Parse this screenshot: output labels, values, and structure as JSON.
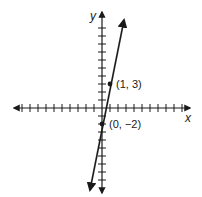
{
  "chart_data": {
    "type": "line",
    "title": "",
    "xlabel": "x",
    "ylabel": "y",
    "xlim": [
      -11,
      10
    ],
    "ylim": [
      -11,
      12
    ],
    "grid": false,
    "equation": "y = 5x - 2",
    "series": [
      {
        "name": "line",
        "x": [
          -2.3,
          3
        ],
        "y": [
          -10.2,
          12
        ]
      }
    ],
    "points": [
      {
        "label": "(1, 3)",
        "x": 1,
        "y": 3
      },
      {
        "label": "(0, −2)",
        "x": 0,
        "y": -2
      }
    ],
    "color": "#1a1a1a"
  },
  "axes": {
    "x_label": "x",
    "y_label": "y"
  },
  "points": [
    {
      "label": "(1, 3)"
    },
    {
      "label": "(0, −2)"
    }
  ]
}
